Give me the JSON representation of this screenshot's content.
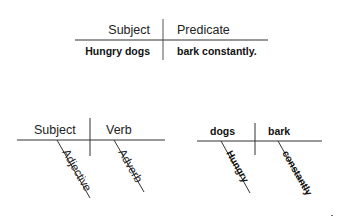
{
  "diagrams": [
    {
      "name": "subject-predicate-table",
      "headers": {
        "left": "Subject",
        "right": "Predicate"
      },
      "values": {
        "left": "Hungry dogs",
        "right": "bark constantly."
      }
    },
    {
      "name": "generic-sentence-diagram",
      "base": {
        "left": "Subject",
        "right": "Verb"
      },
      "modifiers": {
        "left": "Adjective",
        "right": "Adverb"
      }
    },
    {
      "name": "example-sentence-diagram",
      "base": {
        "left": "dogs",
        "right": "bark"
      },
      "modifiers": {
        "left": "Hungry",
        "right": "constantly"
      }
    }
  ]
}
